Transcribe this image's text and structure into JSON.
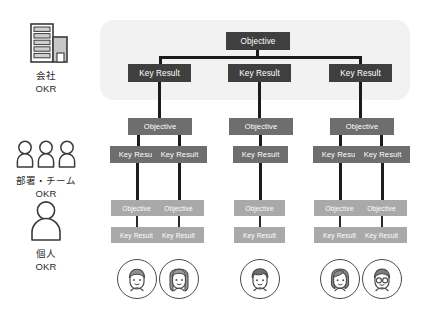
{
  "diagram": {
    "colors": {
      "company_box": "#3f3f3f",
      "team_box": "#6e6e6e",
      "person_box": "#a9a9a9",
      "panel_background": "#f2f2f2",
      "connector": "#1c1c1c",
      "page_background": "#ffffff"
    },
    "labels": {
      "objective": "Objective",
      "key_result": "Key Result"
    }
  },
  "legend": {
    "items": [
      {
        "id": "company",
        "icon": "office-building-icon",
        "line1": "会社",
        "line2": "OKR"
      },
      {
        "id": "team",
        "icon": "three-people-icon",
        "line1": "部署・チーム",
        "line2": "OKR"
      },
      {
        "id": "individual",
        "icon": "single-person-icon",
        "line1": "個人",
        "line2": "OKR"
      }
    ]
  },
  "tiers": {
    "company": {
      "objectives": [
        {
          "label": "Objective",
          "key_results": [
            {
              "label": "Key Result"
            },
            {
              "label": "Key Result"
            },
            {
              "label": "Key Result"
            }
          ]
        }
      ]
    },
    "team": {
      "objectives": [
        {
          "label": "Objective",
          "key_results": [
            {
              "label": "Key Result"
            },
            {
              "label": "Key Result"
            }
          ]
        },
        {
          "label": "Objective",
          "key_results": [
            {
              "label": "Key Result"
            }
          ]
        },
        {
          "label": "Objective",
          "key_results": [
            {
              "label": "Key Result"
            },
            {
              "label": "Key Result"
            }
          ]
        }
      ]
    },
    "individual": {
      "pairs": [
        {
          "objective": "Objective",
          "key_result": "Key Result",
          "avatar": "person-short-hair-avatar"
        },
        {
          "objective": "Objective",
          "key_result": "Key Result",
          "avatar": "person-long-hair-avatar"
        },
        {
          "objective": "Objective",
          "key_result": "Key Result",
          "avatar": "person-wavy-hair-avatar"
        },
        {
          "objective": "Objective",
          "key_result": "Key Result",
          "avatar": "person-bob-hair-avatar"
        },
        {
          "objective": "Objective",
          "key_result": "Key Result",
          "avatar": "person-glasses-avatar"
        }
      ]
    }
  }
}
